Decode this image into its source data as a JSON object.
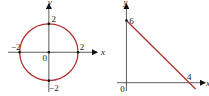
{
  "chart_data": [
    {
      "type": "line",
      "title": "",
      "description": "circle",
      "equation_shape": "circle centered at origin, radius 2",
      "center": [
        0,
        0
      ],
      "radius": 2,
      "xlabel": "x",
      "ylabel": "y",
      "xlim": [
        -2.8,
        3.3
      ],
      "ylim": [
        -2.8,
        3.4
      ],
      "tick_labels": {
        "x": [
          {
            "value": -2,
            "label": "−2"
          },
          {
            "value": 2,
            "label": "2"
          }
        ],
        "y": [
          {
            "value": 2,
            "label": "2"
          },
          {
            "value": -2,
            "label": "−2"
          }
        ],
        "origin": "0"
      },
      "points": [
        [
          2,
          0
        ],
        [
          -2,
          0
        ],
        [
          0,
          2
        ],
        [
          0,
          -2
        ],
        [
          0,
          0
        ]
      ],
      "color": "#b03030"
    },
    {
      "type": "line",
      "title": "",
      "description": "straight line through (0,6) and (4,0)",
      "x": [
        0,
        4.4
      ],
      "y": [
        6,
        -0.6
      ],
      "intercepts": {
        "y": 6,
        "x": 4
      },
      "xlabel": "x",
      "ylabel": "y",
      "xlim": [
        -0.6,
        5.0
      ],
      "ylim": [
        -0.8,
        7.6
      ],
      "tick_labels": {
        "x": [
          {
            "value": 4,
            "label": "4"
          }
        ],
        "y": [
          {
            "value": 6,
            "label": "6"
          }
        ],
        "origin": "0"
      },
      "points": [
        [
          0,
          6
        ]
      ],
      "color": "#b03030"
    }
  ]
}
